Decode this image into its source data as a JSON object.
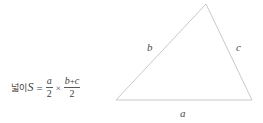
{
  "figure": {
    "background_color": "#ffffff",
    "line_color": "#c9c9c9",
    "text_color": "#4a4a4a"
  },
  "formula": {
    "korean_label": "넓이",
    "result_variable": "S",
    "equals": "=",
    "times": "×",
    "plus": "+",
    "first_fraction": {
      "numerator": "a",
      "denominator": "2"
    },
    "second_fraction": {
      "numerator_left": "b",
      "numerator_right": "c",
      "denominator": "2"
    },
    "plain_text": "넓이 S = a/2 × (b+c)/2"
  },
  "triangle": {
    "vertices": {
      "top": [
        206,
        4
      ],
      "bottom_left": [
        116,
        100
      ],
      "bottom_right": [
        252,
        100
      ]
    },
    "side_labels": {
      "base": "a",
      "left": "b",
      "right": "c"
    }
  }
}
